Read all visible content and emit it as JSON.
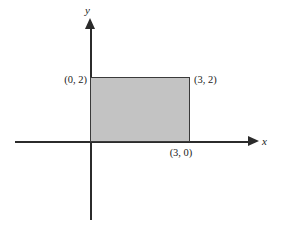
{
  "figure": {
    "title": "",
    "axes": {
      "x_label": "x",
      "y_label": "y"
    },
    "point_labels": {
      "top_left": "(0, 2)",
      "top_right": "(3, 2)",
      "bottom_right": "(3, 0)"
    },
    "colors": {
      "fill": "#c3c3c3",
      "stroke": "#3a3a3a",
      "axis": "#2b2b2b",
      "text": "#1a1a1a",
      "background": "#ffffff"
    }
  },
  "chart_data": {
    "type": "area",
    "title": "",
    "xlabel": "x",
    "ylabel": "y",
    "grid": false,
    "legend": null,
    "xlim": [
      -1.5,
      4.8
    ],
    "ylim": [
      -2.4,
      3.7
    ],
    "shaded_region": {
      "name": "rectangle",
      "vertices": [
        [
          0,
          0
        ],
        [
          0,
          2
        ],
        [
          3,
          2
        ],
        [
          3,
          0
        ]
      ],
      "width": 3,
      "height": 2,
      "area": 6,
      "fill": "#c3c3c3",
      "stroke": "#3a3a3a"
    },
    "annotations": [
      {
        "text": "(0, 2)",
        "x": 0,
        "y": 2,
        "position": "left"
      },
      {
        "text": "(3, 2)",
        "x": 3,
        "y": 2,
        "position": "right"
      },
      {
        "text": "(3, 0)",
        "x": 3,
        "y": 0,
        "position": "below"
      }
    ]
  }
}
